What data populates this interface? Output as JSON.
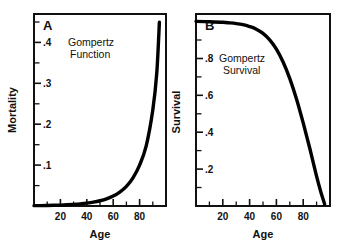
{
  "figure": {
    "background": "#ffffff",
    "ink": "#111111",
    "curve_color": "#000000"
  },
  "chart_data": [
    {
      "type": "line",
      "panel_letter": "A",
      "title": "",
      "annotation_lines": [
        "Gompertz",
        "Function"
      ],
      "xlabel": "Age",
      "ylabel": "Mortality",
      "xlim": [
        0,
        100
      ],
      "ylim": [
        0,
        0.47
      ],
      "grid": false,
      "legend": "none",
      "x_major_ticks": [
        20,
        40,
        60,
        80
      ],
      "x_major_tick_labels": [
        "20",
        "40",
        "60",
        "80"
      ],
      "x_minor_ticks": [
        10,
        30,
        50,
        70,
        90
      ],
      "y_major_ticks": [
        0.1,
        0.2,
        0.3,
        0.4
      ],
      "y_major_tick_labels": [
        ".1",
        ".2",
        ".3",
        ".4"
      ],
      "y_minor_ticks": [
        0.05,
        0.15,
        0.25,
        0.35,
        0.45
      ],
      "series": [
        {
          "name": "Gompertz mortality",
          "x": [
            0,
            5,
            10,
            15,
            20,
            25,
            30,
            35,
            40,
            45,
            50,
            55,
            60,
            65,
            70,
            75,
            80,
            85,
            90,
            93,
            95
          ],
          "values": [
            0.0008,
            0.001,
            0.0013,
            0.0017,
            0.0022,
            0.0029,
            0.0039,
            0.0052,
            0.007,
            0.0094,
            0.0128,
            0.0175,
            0.0242,
            0.0339,
            0.048,
            0.069,
            0.1,
            0.147,
            0.235,
            0.325,
            0.45
          ]
        }
      ]
    },
    {
      "type": "line",
      "panel_letter": "B",
      "title": "",
      "annotation_lines": [
        "Gompertz",
        "Survival"
      ],
      "xlabel": "Age",
      "ylabel": "Survival",
      "xlim": [
        0,
        100
      ],
      "ylim": [
        0,
        1.04
      ],
      "grid": false,
      "legend": "none",
      "x_major_ticks": [
        20,
        40,
        60,
        80
      ],
      "x_major_tick_labels": [
        "20",
        "40",
        "60",
        "80"
      ],
      "x_minor_ticks": [
        10,
        30,
        50,
        70,
        90
      ],
      "y_major_ticks": [
        0.2,
        0.4,
        0.6,
        0.8
      ],
      "y_major_tick_labels": [
        ".2",
        ".4",
        ".6",
        ".8"
      ],
      "y_minor_ticks": [
        0.1,
        0.3,
        0.5,
        0.7,
        0.9,
        1.0
      ],
      "series": [
        {
          "name": "Gompertz survival",
          "x": [
            0,
            10,
            20,
            25,
            30,
            35,
            40,
            45,
            50,
            55,
            60,
            65,
            70,
            75,
            80,
            85,
            90,
            93,
            96
          ],
          "values": [
            1.0,
            0.998,
            0.995,
            0.992,
            0.988,
            0.982,
            0.972,
            0.958,
            0.935,
            0.9,
            0.85,
            0.78,
            0.69,
            0.58,
            0.45,
            0.31,
            0.16,
            0.08,
            0.01
          ]
        }
      ]
    }
  ]
}
